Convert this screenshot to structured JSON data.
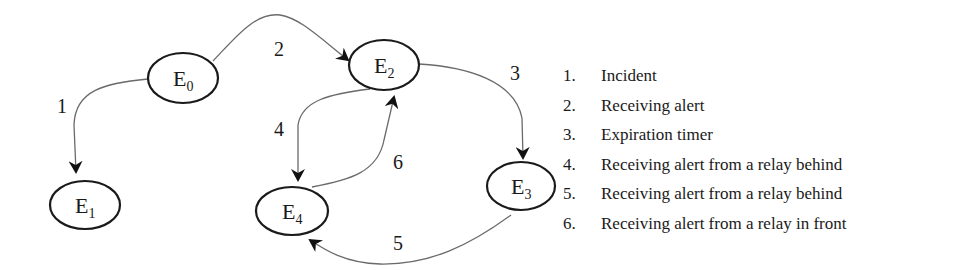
{
  "diagram": {
    "type": "state-transition-diagram",
    "nodes": [
      {
        "id": "E0",
        "label": "E",
        "sub": "0",
        "cx": 183,
        "cy": 78,
        "rx": 35,
        "ry": 25
      },
      {
        "id": "E1",
        "label": "E",
        "sub": "1",
        "cx": 85,
        "cy": 205,
        "rx": 35,
        "ry": 24
      },
      {
        "id": "E2",
        "label": "E",
        "sub": "2",
        "cx": 384,
        "cy": 65,
        "rx": 35,
        "ry": 25
      },
      {
        "id": "E3",
        "label": "E",
        "sub": "3",
        "cx": 521,
        "cy": 186,
        "rx": 34,
        "ry": 24
      },
      {
        "id": "E4",
        "label": "E",
        "sub": "4",
        "cx": 292,
        "cy": 211,
        "rx": 36,
        "ry": 24
      }
    ],
    "edges": [
      {
        "id": "1",
        "from": "E0",
        "to": "E1",
        "label": "1"
      },
      {
        "id": "2",
        "from": "E0",
        "to": "E2",
        "label": "2"
      },
      {
        "id": "3",
        "from": "E2",
        "to": "E3",
        "label": "3"
      },
      {
        "id": "4",
        "from": "E2",
        "to": "E4",
        "label": "4"
      },
      {
        "id": "5",
        "from": "E3",
        "to": "E4",
        "label": "5"
      },
      {
        "id": "6",
        "from": "E4",
        "to": "E2",
        "label": "6"
      }
    ]
  },
  "legend": {
    "items": [
      {
        "num": "1.",
        "text": "Incident"
      },
      {
        "num": "2.",
        "text": "Receiving alert"
      },
      {
        "num": "3.",
        "text": "Expiration timer"
      },
      {
        "num": "4.",
        "text": "Receiving alert from a relay behind"
      },
      {
        "num": "5.",
        "text": "Receiving alert from a relay behind"
      },
      {
        "num": "6.",
        "text": "Receiving alert from a relay in front"
      }
    ]
  },
  "colors": {
    "node_stroke": "#1a1a1a",
    "edge_stroke": "#6a6a6a",
    "text": "#1a1a1a",
    "background": "#ffffff"
  }
}
